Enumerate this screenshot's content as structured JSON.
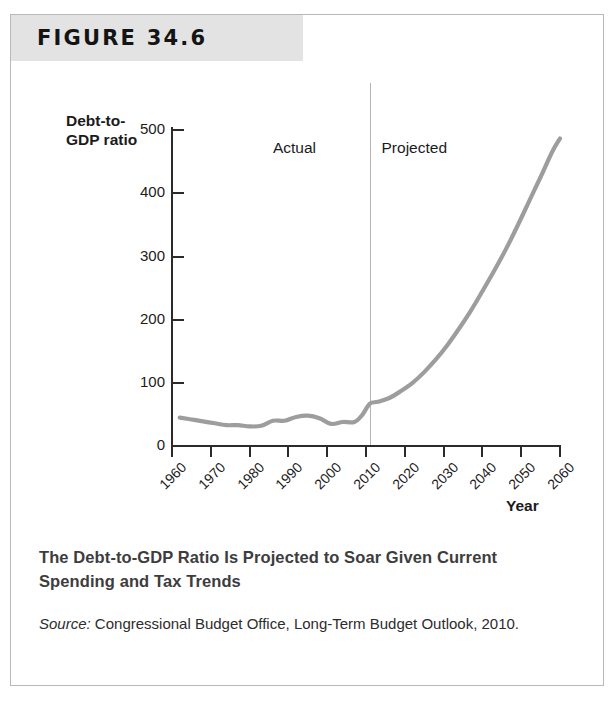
{
  "figure": {
    "header_label": "FIGURE 34.6",
    "caption_title": "The Debt-to-GDP Ratio Is Projected to Soar Given Current Spending and Tax Trends",
    "source_label": "Source:",
    "source_text": " Congressional Budget Office, Long-Term Budget Outlook, 2010."
  },
  "colors": {
    "header_band": "#e3e3e3",
    "series_line": "#9d9d9d",
    "axis": "#2b2b2b",
    "divider": "#b4b4b4",
    "caption_title": "#3d3d3d"
  },
  "chart_data": {
    "type": "line",
    "title": "",
    "xlabel": "Year",
    "ylabel": "Debt-to-GDP ratio",
    "ylabel_lines": [
      "Debt-to-",
      "GDP ratio"
    ],
    "xlim": [
      1960,
      2060
    ],
    "ylim": [
      0,
      540
    ],
    "yticks": [
      0,
      100,
      200,
      300,
      400,
      500
    ],
    "ytick_labels": [
      "0",
      "100",
      "200",
      "300",
      "400",
      "500"
    ],
    "xticks": [
      1960,
      1970,
      1980,
      1990,
      2000,
      2010,
      2020,
      2030,
      2040,
      2050,
      2060
    ],
    "xtick_labels": [
      "1960",
      "1970",
      "1980",
      "1990",
      "2000",
      "2010",
      "2020",
      "2030",
      "2040",
      "2050",
      "2060"
    ],
    "grid": false,
    "legend": false,
    "annotations": [
      {
        "text": "Actual",
        "x": 2002,
        "y": 470
      },
      {
        "text": "Projected",
        "x": 2014,
        "y": 470
      }
    ],
    "divider_x": 2011,
    "series": [
      {
        "name": "Debt-to-GDP ratio",
        "x": [
          1962,
          1965,
          1968,
          1971,
          1974,
          1977,
          1980,
          1983,
          1986,
          1989,
          1992,
          1995,
          1998,
          2001,
          2004,
          2007,
          2009,
          2011,
          2013,
          2016,
          2019,
          2022,
          2025,
          2028,
          2031,
          2034,
          2037,
          2040,
          2043,
          2046,
          2049,
          2052,
          2055,
          2058,
          2060
        ],
        "values": [
          45,
          42,
          39,
          36,
          33,
          33,
          31,
          32,
          40,
          40,
          46,
          48,
          44,
          35,
          38,
          38,
          49,
          67,
          70,
          76,
          87,
          100,
          117,
          137,
          160,
          186,
          214,
          245,
          277,
          311,
          348,
          387,
          426,
          466,
          487
        ]
      }
    ]
  }
}
